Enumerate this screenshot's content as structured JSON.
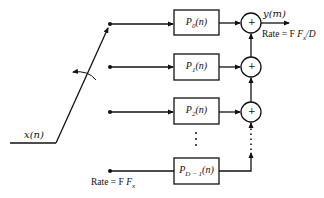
{
  "diagram": {
    "type": "polyphase-decimator-block-diagram",
    "input": {
      "label": "x(n)",
      "rate_label": "Rate = F",
      "rate_symbol": "x"
    },
    "output": {
      "label": "y(m)",
      "rate_label": "Rate = F",
      "rate_symbol": "x",
      "rate_suffix": "/D"
    },
    "commutator": {
      "icon": "rotation-arrow-icon"
    },
    "filters": [
      {
        "name": "P",
        "sub": "0",
        "arg": "(n)"
      },
      {
        "name": "P",
        "sub": "1",
        "arg": "(n)"
      },
      {
        "name": "P",
        "sub": "2",
        "arg": "(n)"
      },
      {
        "name": "P",
        "sub": "D − 1",
        "arg": "(n)"
      }
    ],
    "adders": [
      {
        "symbol": "+"
      },
      {
        "symbol": "+"
      },
      {
        "symbol": "+"
      }
    ],
    "ellipsis": "⋮",
    "colors": {
      "stroke": "#111111",
      "background": "#ffffff"
    }
  }
}
